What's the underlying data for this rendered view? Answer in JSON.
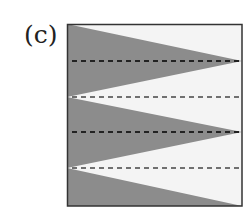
{
  "figure": {
    "label": "(c)",
    "box": {
      "x": 67,
      "y": 24,
      "width": 175,
      "height": 182
    },
    "colors": {
      "background": "#f4f4f4",
      "shaded": "#8c8c8c",
      "border": "#333333",
      "dash_dark": "#222222",
      "dash_light": "#555555"
    },
    "dashed_lines_y": [
      61,
      97,
      132,
      168
    ],
    "triangles": [
      {
        "name": "shaded-wedge-1",
        "points": "67,24 242,61 67,97"
      },
      {
        "name": "shaded-wedge-2",
        "points": "67,97 242,132 67,168"
      },
      {
        "name": "shaded-wedge-3",
        "points": "67,168 242,206 67,206"
      }
    ]
  }
}
